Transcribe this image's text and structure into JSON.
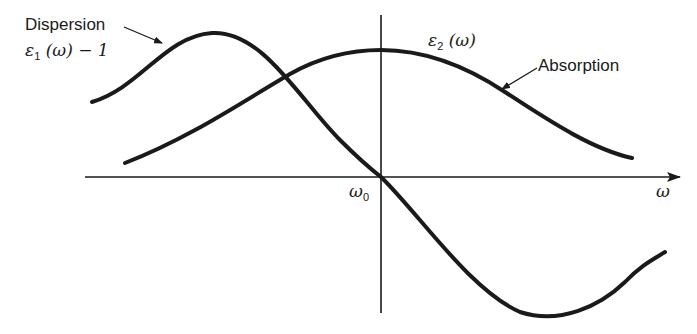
{
  "diagram": {
    "axis": {
      "x_label": "ω",
      "origin_label": {
        "sym": "ω",
        "sub": "0"
      }
    },
    "curves": {
      "dispersion": {
        "name": "Dispersion",
        "expr": {
          "sym": "ε",
          "sub": "1",
          "rest": " (ω) − 1"
        }
      },
      "absorption": {
        "name": "Absorption",
        "expr": {
          "sym": "ε",
          "sub": "2",
          "rest": " (ω)"
        }
      }
    },
    "colors": {
      "ink": "#1a1a1a",
      "background": "#ffffff"
    }
  }
}
